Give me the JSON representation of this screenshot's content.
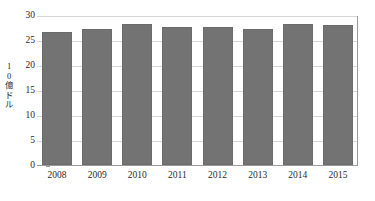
{
  "chart_data": {
    "type": "bar",
    "title": "",
    "subtitle": "",
    "xlabel": "",
    "ylabel": "10億ドル",
    "ylabel_chars": [
      "1",
      "0",
      "億",
      "ド",
      "ル"
    ],
    "categories": [
      "2008",
      "2009",
      "2010",
      "2011",
      "2012",
      "2013",
      "2014",
      "2015"
    ],
    "values": [
      26.6,
      27.2,
      28.2,
      27.6,
      27.6,
      27.2,
      28.2,
      28.1
    ],
    "series": [
      {
        "name": "10億ドル",
        "values": [
          26.6,
          27.2,
          28.2,
          27.6,
          27.6,
          27.2,
          28.2,
          28.1
        ]
      }
    ],
    "ylim": [
      0,
      30
    ],
    "yticks": [
      0,
      5,
      10,
      15,
      20,
      25,
      30
    ],
    "ytick_labels": [
      "0",
      "5",
      "10",
      "15",
      "20",
      "25",
      "30"
    ],
    "grid": true,
    "grid_axis": "y",
    "legend": false,
    "legend_position": "none",
    "bar_color": "#737373",
    "grid_color": "#d6d6d6",
    "axis_color": "#9a9a9a",
    "text_color": "#2a2a2a",
    "background": "#ffffff"
  }
}
